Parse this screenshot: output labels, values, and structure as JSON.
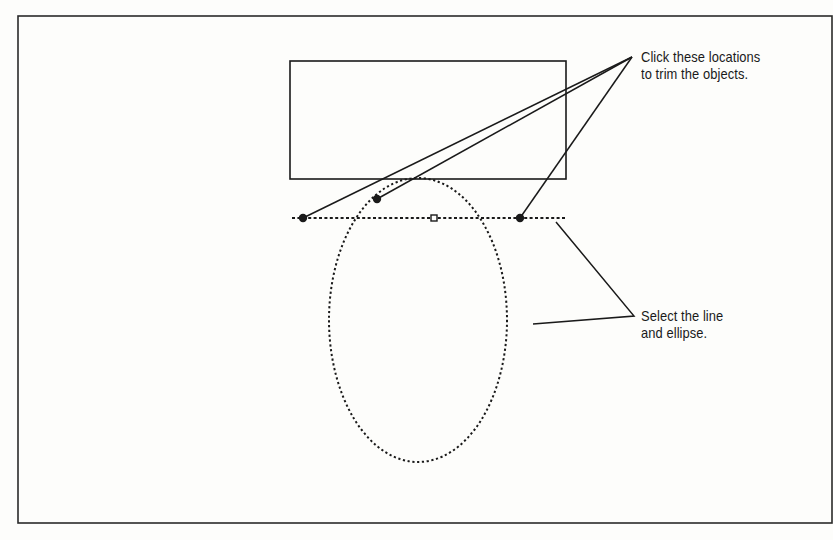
{
  "figure": {
    "frame": {
      "x": 18,
      "y": 16,
      "w": 814,
      "h": 507
    },
    "rectangle": {
      "x": 290,
      "y": 61,
      "w": 276,
      "h": 118
    },
    "ellipse": {
      "cx": 418,
      "cy": 320,
      "rx": 89,
      "ry": 142
    },
    "dotted_line": {
      "x1": 292,
      "y1": 218,
      "x2": 567,
      "y2": 218
    },
    "midpoint_grip": {
      "x": 434,
      "y": 218,
      "size": 6
    },
    "trim_points": [
      {
        "x": 303,
        "y": 218
      },
      {
        "x": 377,
        "y": 199
      },
      {
        "x": 520,
        "y": 218
      }
    ],
    "leader_origin_top": {
      "x": 632,
      "y": 57
    },
    "leader_bottom": {
      "from": {
        "x": 556,
        "y": 222
      },
      "elbow": {
        "x": 634,
        "y": 316
      },
      "to": {
        "x": 533,
        "y": 324
      }
    },
    "colors": {
      "stroke": "#1a1a1a",
      "background": "#fdfdfb"
    }
  },
  "callouts": {
    "trim": {
      "line1": "Click these locations",
      "line2": "to trim the objects."
    },
    "select": {
      "line1": "Select the line",
      "line2": "and ellipse."
    }
  }
}
